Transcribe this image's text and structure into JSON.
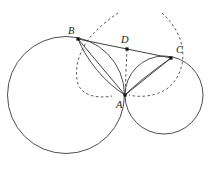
{
  "figure": {
    "width": 217,
    "height": 169,
    "background_color": "#ffffff",
    "stroke_color": "#3a3a3a",
    "label_color": "#1a1a1a"
  },
  "points": [
    {
      "id": "B",
      "label": "B",
      "x": 78,
      "y": 39,
      "label_x": 68,
      "label_y": 34
    },
    {
      "id": "D",
      "label": "D",
      "x": 127,
      "y": 49,
      "label_x": 121,
      "label_y": 43
    },
    {
      "id": "C",
      "label": "C",
      "x": 171,
      "y": 58,
      "label_x": 176,
      "label_y": 53
    },
    {
      "id": "A",
      "label": "A",
      "x": 125,
      "y": 95,
      "label_x": 116,
      "label_y": 108
    }
  ],
  "circles": [
    {
      "id": "large-circle",
      "cx": 66,
      "cy": 95,
      "r": 58.5,
      "style": "solid"
    },
    {
      "id": "small-circle",
      "cx": 164,
      "cy": 95,
      "r": 39.0,
      "style": "solid"
    }
  ],
  "arcs": [
    {
      "id": "dashed-arc-left",
      "style": "dashed",
      "path": "M 118 13 C 108 20 96 29 88 40 C 78 54 74 70 78 84 C 82 95 96 99 112 96"
    },
    {
      "id": "dashed-arc-right",
      "style": "dashed",
      "path": "M 162 13 C 172 22 180 34 182 47 C 185 62 180 78 168 88 C 157 96 141 98 129 95"
    }
  ],
  "segments": [
    {
      "id": "segment-BD",
      "style": "solid",
      "from": "B",
      "to": "D"
    },
    {
      "id": "segment-DC",
      "style": "solid",
      "from": "D",
      "to": "C"
    },
    {
      "id": "segment-BA",
      "style": "solid",
      "from": "B",
      "to": "A"
    },
    {
      "id": "segment-CA",
      "style": "solid",
      "from": "C",
      "to": "A"
    },
    {
      "id": "segment-DA",
      "style": "dashed",
      "from": "D",
      "to": "A"
    }
  ],
  "chords": [
    {
      "id": "chord-arc-BA",
      "style": "solid",
      "path": "M 78 39 C 86 59 104 82 125 95"
    },
    {
      "id": "chord-arc-CA",
      "style": "solid",
      "path": "M 171 58 C 160 66 140 80 125 95"
    }
  ],
  "legend": {
    "solid_label": "solid construction line",
    "dashed_label": "dashed auxiliary arc"
  }
}
